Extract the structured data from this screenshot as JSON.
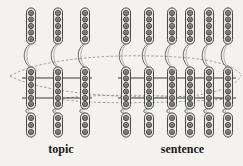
{
  "figure": {
    "background_color": "#f4f2ee",
    "width": 243,
    "height": 166,
    "node_fill": "#8f8f8f",
    "node_stroke": "#3a3a3a",
    "capsule_fill": "#e8e6e2",
    "capsule_stroke": "#4a4a4a",
    "connector_color": "#555555",
    "cross_line_color": "#3a3a3a",
    "dashed_color": "#8c8c8c"
  },
  "labels": {
    "topic": "topic",
    "sentence": "sentence"
  },
  "groups": [
    {
      "id": "topic",
      "label": "topic",
      "column_count": 3,
      "column_x": [
        31,
        58,
        85
      ],
      "columns": [
        {
          "index": 0,
          "x": 31,
          "capsules": [
            {
              "band": "top",
              "cy": 26,
              "node_count": 5,
              "node_ys": [
                13,
                19.5,
                26,
                32.5,
                39
              ]
            },
            {
              "band": "middle",
              "cy": 88,
              "node_count": 6,
              "node_ys": [
                72,
                78.5,
                85,
                91.5,
                98,
                104
              ]
            },
            {
              "band": "bottom",
              "cy": 126,
              "node_count": 3,
              "node_ys": [
                118,
                125,
                132
              ]
            }
          ]
        },
        {
          "index": 1,
          "x": 58,
          "capsules": [
            {
              "band": "top",
              "cy": 26,
              "node_count": 5,
              "node_ys": [
                13,
                19.5,
                26,
                32.5,
                39
              ]
            },
            {
              "band": "middle",
              "cy": 88,
              "node_count": 6,
              "node_ys": [
                72,
                78.5,
                85,
                91.5,
                98,
                104
              ]
            },
            {
              "band": "bottom",
              "cy": 126,
              "node_count": 3,
              "node_ys": [
                118,
                125,
                132
              ]
            }
          ]
        },
        {
          "index": 2,
          "x": 85,
          "capsules": [
            {
              "band": "top",
              "cy": 26,
              "node_count": 5,
              "node_ys": [
                13,
                19.5,
                26,
                32.5,
                39
              ]
            },
            {
              "band": "middle",
              "cy": 88,
              "node_count": 6,
              "node_ys": [
                72,
                78.5,
                85,
                91.5,
                98,
                104
              ]
            },
            {
              "band": "bottom",
              "cy": 126,
              "node_count": 3,
              "node_ys": [
                118,
                125,
                132
              ]
            }
          ]
        }
      ]
    },
    {
      "id": "sentence",
      "label": "sentence",
      "column_count": 6,
      "column_x": [
        126,
        149,
        172,
        190,
        209,
        228
      ],
      "columns": [
        {
          "index": 0,
          "x": 126,
          "capsules": [
            {
              "band": "top",
              "cy": 26,
              "node_count": 5,
              "node_ys": [
                13,
                19.5,
                26,
                32.5,
                39
              ]
            },
            {
              "band": "middle",
              "cy": 88,
              "node_count": 6,
              "node_ys": [
                72,
                78.5,
                85,
                91.5,
                98,
                104
              ]
            },
            {
              "band": "bottom",
              "cy": 126,
              "node_count": 3,
              "node_ys": [
                118,
                125,
                132
              ]
            }
          ]
        },
        {
          "index": 1,
          "x": 149,
          "capsules": [
            {
              "band": "top",
              "cy": 26,
              "node_count": 5,
              "node_ys": [
                13,
                19.5,
                26,
                32.5,
                39
              ]
            },
            {
              "band": "middle",
              "cy": 88,
              "node_count": 6,
              "node_ys": [
                72,
                78.5,
                85,
                91.5,
                98,
                104
              ]
            },
            {
              "band": "bottom",
              "cy": 126,
              "node_count": 3,
              "node_ys": [
                118,
                125,
                132
              ]
            }
          ]
        },
        {
          "index": 2,
          "x": 172,
          "capsules": [
            {
              "band": "top",
              "cy": 26,
              "node_count": 5,
              "node_ys": [
                13,
                19.5,
                26,
                32.5,
                39
              ]
            },
            {
              "band": "middle",
              "cy": 88,
              "node_count": 6,
              "node_ys": [
                72,
                78.5,
                85,
                91.5,
                98,
                104
              ]
            },
            {
              "band": "bottom",
              "cy": 126,
              "node_count": 3,
              "node_ys": [
                118,
                125,
                132
              ]
            }
          ]
        },
        {
          "index": 3,
          "x": 190,
          "capsules": [
            {
              "band": "top",
              "cy": 26,
              "node_count": 5,
              "node_ys": [
                13,
                19.5,
                26,
                32.5,
                39
              ]
            },
            {
              "band": "middle",
              "cy": 88,
              "node_count": 6,
              "node_ys": [
                72,
                78.5,
                85,
                91.5,
                98,
                104
              ]
            },
            {
              "band": "bottom",
              "cy": 126,
              "node_count": 3,
              "node_ys": [
                118,
                125,
                132
              ]
            }
          ]
        },
        {
          "index": 4,
          "x": 209,
          "capsules": [
            {
              "band": "top",
              "cy": 26,
              "node_count": 5,
              "node_ys": [
                13,
                19.5,
                26,
                32.5,
                39
              ]
            },
            {
              "band": "middle",
              "cy": 88,
              "node_count": 6,
              "node_ys": [
                72,
                78.5,
                85,
                91.5,
                98,
                104
              ]
            },
            {
              "band": "bottom",
              "cy": 126,
              "node_count": 3,
              "node_ys": [
                118,
                125,
                132
              ]
            }
          ]
        },
        {
          "index": 5,
          "x": 228,
          "capsules": [
            {
              "band": "top",
              "cy": 26,
              "node_count": 5,
              "node_ys": [
                13,
                19.5,
                26,
                32.5,
                39
              ]
            },
            {
              "band": "middle",
              "cy": 88,
              "node_count": 6,
              "node_ys": [
                72,
                78.5,
                85,
                91.5,
                98,
                104
              ]
            },
            {
              "band": "bottom",
              "cy": 126,
              "node_count": 3,
              "node_ys": [
                118,
                125,
                132
              ]
            }
          ]
        }
      ]
    }
  ],
  "cross_lines": [
    {
      "id": "upper-cross-line",
      "y": 78,
      "segments": [
        [
          22,
          92
        ],
        [
          118,
          236
        ]
      ]
    },
    {
      "id": "lower-cross-line",
      "y": 98,
      "segments": [
        [
          22,
          92
        ],
        [
          118,
          236
        ]
      ]
    }
  ],
  "dashed_arcs": [
    {
      "id": "upper-dashed-arc",
      "description": "dashed ellipse arc spanning topic to sentence, upper"
    },
    {
      "id": "lower-dashed-arc",
      "description": "dashed ellipse arc spanning topic to sentence, lower"
    }
  ],
  "geometry": {
    "node_radius": 2.6,
    "node_inner_radius": 1.5,
    "capsule_width": 9,
    "capsule_radius": 4.5
  }
}
